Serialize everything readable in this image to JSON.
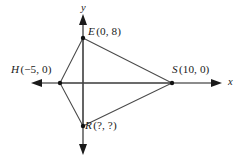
{
  "figure": {
    "kind": "coordinate-plane-diagram",
    "background_color": "#ffffff",
    "axis_color": "#1a1a1a",
    "edge_color": "#4a4a4a",
    "vertex_color": "#111111",
    "axes": {
      "x_label": "x",
      "y_label": "y",
      "x_arrows": "both",
      "y_arrows": "both"
    },
    "points": [
      {
        "id": "E",
        "name": "E",
        "coords": "(0, 8)",
        "x": 0,
        "y": 8
      },
      {
        "id": "H",
        "name": "H",
        "coords": "(−5, 0)",
        "x": -5,
        "y": 0
      },
      {
        "id": "S",
        "name": "S",
        "coords": "(10, 0)",
        "x": 10,
        "y": 0
      },
      {
        "id": "R",
        "name": "R",
        "coords": "(?, ?)",
        "x": null,
        "y": null
      }
    ],
    "segments": [
      "E-H",
      "H-R",
      "R-S",
      "S-E",
      "H-S",
      "E-R"
    ]
  }
}
